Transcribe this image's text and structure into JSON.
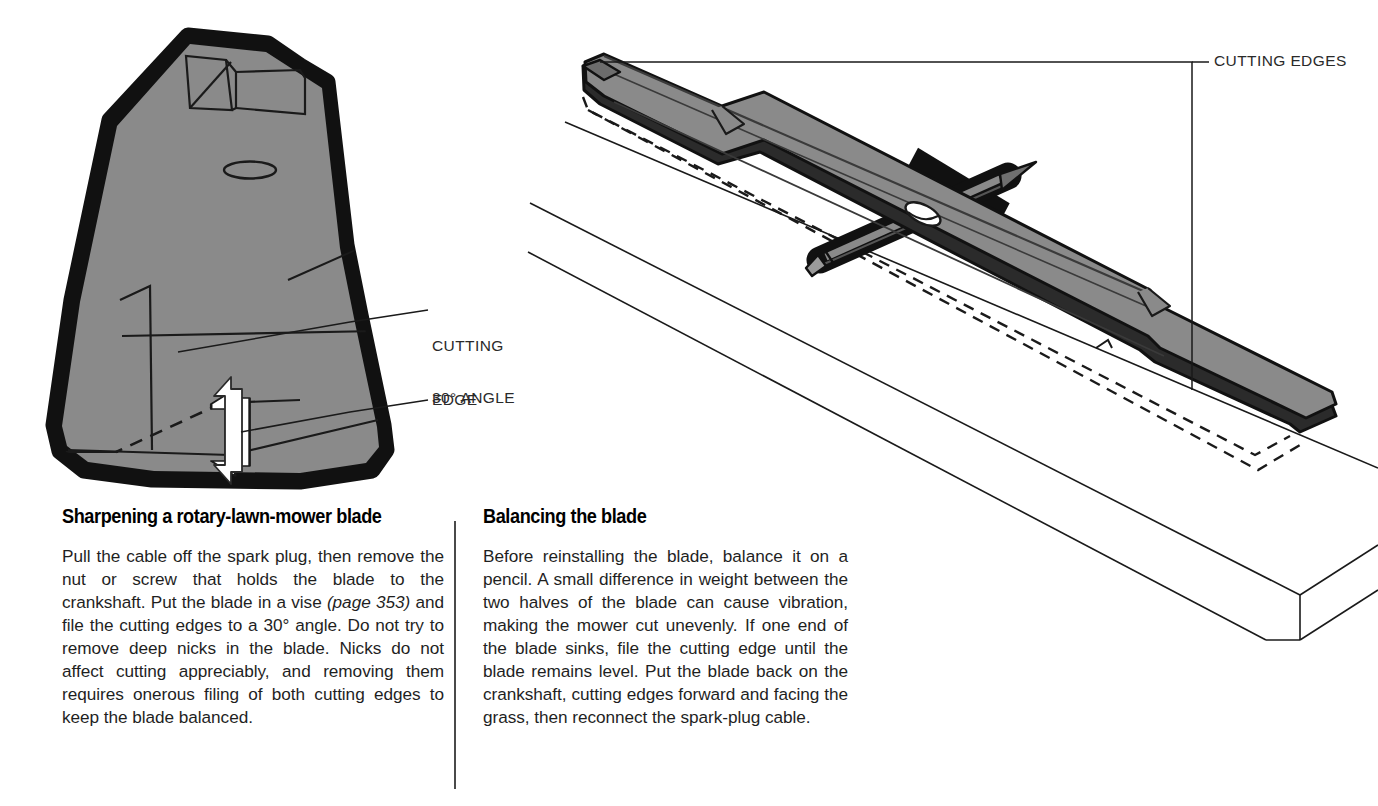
{
  "figure": {
    "alt": "Technical illustration: sharpening and balancing a rotary lawn mower blade",
    "colors": {
      "blade_fill": "#8a8a8a",
      "blade_outline": "#111111",
      "blade_edge_dark": "#2b2b2b",
      "paper": "#ffffff",
      "line": "#1a1a1a",
      "arrow_white": "#ffffff"
    },
    "callouts": [
      {
        "id": "cutting-edges",
        "text": "CUTTING EDGES"
      },
      {
        "id": "cutting-edge",
        "line1": "CUTTING",
        "line2": "EDGE"
      },
      {
        "id": "thirty-degree-angle",
        "text": "30° ANGLE"
      }
    ],
    "left_detail": {
      "name": "blade-tip-closeup",
      "features": [
        "beveled cutting edge",
        "mounting hole",
        "double-headed filing arrow",
        "dashed bevel guide line"
      ]
    },
    "right_detail": {
      "name": "blade-balanced-on-pencil",
      "features": [
        "full mower blade",
        "pencil balance point",
        "center mounting hole",
        "table surface",
        "dashed shadow outline"
      ]
    }
  },
  "text_block": {
    "columns": [
      {
        "id": "sharpening",
        "heading": "Sharpening a rotary-lawn-mower blade",
        "body_before_italic": "Pull the cable off the spark plug, then remove the nut or screw that holds the blade to the crankshaft. Put the blade in a vise ",
        "body_italic": "(page 353)",
        "body_after_italic": " and file the cutting edges to a 30° angle. Do not try to remove deep nicks in the blade. Nicks do not affect cutting appreciably, and removing them requires onerous filing of both cutting edges to keep the blade balanced."
      },
      {
        "id": "balancing",
        "heading": "Balancing the blade",
        "body": "Before reinstalling the blade, balance it on a pencil. A small difference in weight between the two halves of the blade can cause vibration, making the mower cut unevenly. If one end of the blade sinks, file the cutting edge until the blade remains level. Put the blade back on the crankshaft, cutting edges forward and facing the grass, then reconnect the spark-plug cable."
      }
    ]
  }
}
